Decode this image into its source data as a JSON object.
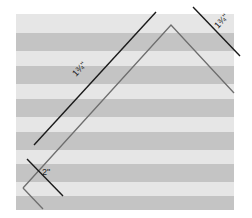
{
  "figure": {
    "colors": {
      "background": "#ffffff",
      "fabric_light": "#e6e6e6",
      "fabric_dark": "#c4c4c4",
      "measure_line": "#1a1a1a",
      "cut_line": "#6e6e6e"
    },
    "labels": {
      "long_measure": "1¾\"",
      "corner_measure": "1¾\"",
      "bottom_measure": "2\""
    },
    "stripe_count": 6
  }
}
